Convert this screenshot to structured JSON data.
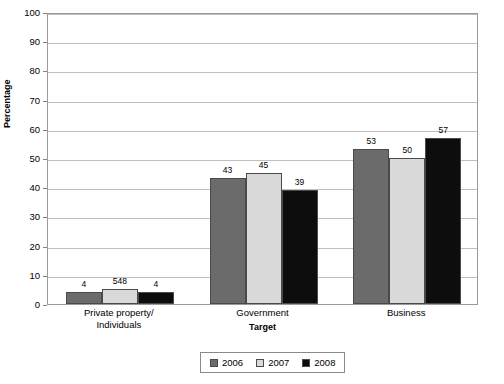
{
  "chart_data": {
    "type": "bar",
    "title": "",
    "xlabel": "Target",
    "ylabel": "Percentage",
    "categories": [
      "Private property/\nIndividuals",
      "Government",
      "Business"
    ],
    "category_lines": [
      [
        "Private property/",
        "Individuals"
      ],
      [
        "Government"
      ],
      [
        "Business"
      ]
    ],
    "series": [
      {
        "name": "2006",
        "color": "#6b6b6b",
        "values": [
          4,
          43,
          53
        ],
        "labels": [
          "4",
          "43",
          "53"
        ]
      },
      {
        "name": "2007",
        "color": "#d9d9d9",
        "values": [
          5,
          45,
          50
        ],
        "labels": [
          "548",
          "45",
          "50"
        ]
      },
      {
        "name": "2008",
        "color": "#0d0d0d",
        "values": [
          4,
          39,
          57
        ],
        "labels": [
          "4",
          "39",
          "57"
        ]
      }
    ],
    "ylim": [
      0,
      100
    ],
    "ytick_step": 10,
    "yticks": [
      "100",
      "90",
      "80",
      "70",
      "60",
      "50",
      "40",
      "30",
      "20",
      "10",
      "0"
    ],
    "grid": true,
    "legend_position": "bottom",
    "bar_border_color": "#4a4a4a",
    "grid_color": "#bfbfbf",
    "axis_color": "#9a9a9a"
  },
  "legend": {
    "entries": [
      {
        "label": "2006",
        "color": "#6b6b6b"
      },
      {
        "label": "2007",
        "color": "#d9d9d9"
      },
      {
        "label": "2008",
        "color": "#0d0d0d"
      }
    ]
  }
}
